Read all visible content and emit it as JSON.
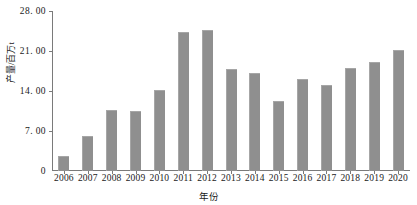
{
  "chart_data": {
    "type": "bar",
    "title": "",
    "subtitle": "",
    "xlabel": "年份",
    "ylabel": "产量/百万t",
    "categories": [
      "2006",
      "2007",
      "2008",
      "2009",
      "2010",
      "2011",
      "2012",
      "2013",
      "2014",
      "2015",
      "2016",
      "2017",
      "2018",
      "2019",
      "2020"
    ],
    "values": [
      2.6,
      6.2,
      10.7,
      10.5,
      14.1,
      24.3,
      24.7,
      17.9,
      17.2,
      12.2,
      16.1,
      15.0,
      18.0,
      19.0,
      21.1
    ],
    "series": [
      {
        "name": "产量",
        "values": [
          2.6,
          6.2,
          10.7,
          10.5,
          14.1,
          24.3,
          24.7,
          17.9,
          17.2,
          12.2,
          16.1,
          15.0,
          18.0,
          19.0,
          21.1
        ]
      }
    ],
    "ylim": [
      0,
      28
    ],
    "yticks": [
      0,
      7,
      14,
      21,
      28
    ],
    "ytick_labels": [
      "0",
      "7. 00",
      "14. 00",
      "21. 00",
      "28. 00"
    ],
    "xtick_labels": [
      "2006",
      "2007",
      "2008",
      "2009",
      "2010",
      "2011",
      "2012",
      "2013",
      "2014",
      "2015",
      "2016",
      "2017",
      "2018",
      "2019",
      "2020"
    ],
    "grid": false,
    "legend": false,
    "legend_position": "none",
    "bar_color": "#8f8f8f",
    "axis_color": "#7a7a7a",
    "text_color": "#1a1a1a",
    "background": "#ffffff",
    "annotations": []
  }
}
